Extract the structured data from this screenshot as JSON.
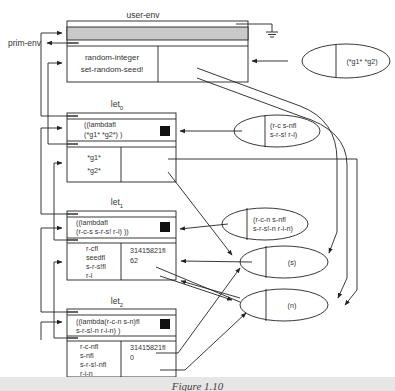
{
  "frames": {
    "user_env": {
      "label": "user-env",
      "bindings": [
        "random-integer",
        "set-random-seed!"
      ],
      "parent": "prim-env"
    },
    "prim_env": {
      "label": "prim-env"
    },
    "let0": {
      "label": "let",
      "subscript": "0",
      "expr_line1": "((lambdafl",
      "expr_line2": "(*g1* *g2*) )",
      "bindings": [
        "*g1*",
        "*g2*"
      ]
    },
    "let1": {
      "label": "let",
      "subscript": "1",
      "expr_line1": "((lambdafl",
      "expr_line2": "(r-c-s s-r-s! r-i) ))",
      "bindings": [
        "r-cfl",
        "seedfl",
        "s-r-s!fl",
        "r-i"
      ],
      "values": [
        "31415821fl",
        "62"
      ]
    },
    "let2": {
      "label": "let",
      "subscript": "2",
      "expr_line1": "((lambda(r-c-n s-n)fl",
      "expr_line2": "s-r-s!-n r-i-n) )",
      "bindings": [
        "r-c-nfl",
        "s-nfl",
        "s-r-s!-nfl",
        "r-i-n"
      ],
      "values": [
        "31415821fl",
        "0"
      ]
    }
  },
  "closures": {
    "c_user": {
      "params": "(*g1* *g2)"
    },
    "c_let0": {
      "line1": "(r-c s-nfl",
      "line2": "s-r-s! r-i)"
    },
    "c_let1": {
      "line1": "(r-c-n s-nfl",
      "line2": "s-r-s!-n r-i-n)"
    },
    "c_s": {
      "params": "(s)"
    },
    "c_n": {
      "params": "(n)"
    }
  },
  "caption": "Figure 1.10"
}
